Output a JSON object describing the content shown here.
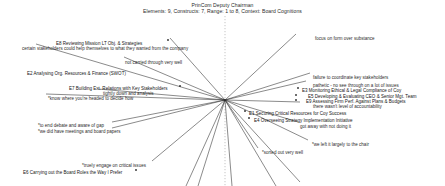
{
  "header": {
    "title": "PrinCom  Deputy Chairman",
    "subtitle": "Elements: 9, Constructs: 7, Range: 1 to 8, Context: Board Cognitions"
  },
  "chart_data": {
    "type": "scatter",
    "title": "PrinCom  Deputy Chairman",
    "subtitle": "Elements: 9, Constructs: 7, Range: 1 to 8, Context: Board Cognitions",
    "xlabel": "",
    "ylabel": "",
    "grid": false,
    "legend": "none",
    "n_elements": 9,
    "n_constructs": 7,
    "rating_range": [
      1,
      8
    ],
    "context": "Board Cognitions",
    "origin": {
      "x": 225,
      "y": 100
    },
    "axis": {
      "type": "dotted-vertical",
      "x": 225,
      "y1": 16,
      "y2": 186
    },
    "elements": [
      {
        "id": "E8",
        "label": "E8 Reviewing Mission LT Obj. & Strategies",
        "x": 56,
        "y": 41,
        "marker_x": 168,
        "marker_y": 40
      },
      {
        "id": "E2",
        "label": "E2 Analysing Org. Resources & Finance  (SWOT)",
        "x": 27,
        "y": 71,
        "marker_x": null,
        "marker_y": null
      },
      {
        "id": "E7",
        "label": "E7 Building Ext. Relations with Key Stakeholders",
        "x": 69,
        "y": 86,
        "marker_x": 180,
        "marker_y": 86
      },
      {
        "id": "E6",
        "label": "E6 Carrying out the Board Roles the Way I Prefer",
        "x": 23,
        "y": 170,
        "marker_x": 136,
        "marker_y": 170
      },
      {
        "id": "E3",
        "label": "E3 Monitoring Ethical & Legal Compliance of Coy",
        "x": 302,
        "y": 88,
        "marker_x": 298,
        "marker_y": 88
      },
      {
        "id": "E5",
        "label": "E5 Developing & Evaluating CEO & Senior Mgt. Team",
        "x": 308,
        "y": 94,
        "marker_x": 296,
        "marker_y": 95
      },
      {
        "id": "E9",
        "label": "E9 Assessing Firm Perf. Against Plans & Budgets",
        "x": 306,
        "y": 99,
        "marker_x": 296,
        "marker_y": 100
      },
      {
        "id": "E1",
        "label": "E1 Securing Critical Resources for Coy Success",
        "x": 249,
        "y": 111,
        "marker_x": 245,
        "marker_y": 111
      },
      {
        "id": "E4",
        "label": "E4 Overseeing Strategy Implementation Initiative",
        "x": 254,
        "y": 118,
        "marker_x": 249,
        "marker_y": 118
      }
    ],
    "construct_poles": [
      {
        "text": "certain stakeholders could help themselves to what they wanted from the company",
        "x": 22,
        "y": 46
      },
      {
        "text": "not carried through very well",
        "x": 125,
        "y": 60
      },
      {
        "text": "tightly down and analysis",
        "x": 103,
        "y": 91
      },
      {
        "text": "*know where you're headed to decide how",
        "x": 48,
        "y": 96
      },
      {
        "text": "*to end debate and aware of gap",
        "x": 38,
        "y": 123
      },
      {
        "text": "*we did have meetings and board papers",
        "x": 38,
        "y": 129
      },
      {
        "text": "*truely engage on critical issues",
        "x": 82,
        "y": 163
      },
      {
        "text": "focus on form over substance",
        "x": 315,
        "y": 36
      },
      {
        "text": "failure to coordinate key stakeholders",
        "x": 313,
        "y": 75
      },
      {
        "text": "pathetic - no see through on a lot of issues",
        "x": 313,
        "y": 83
      },
      {
        "text": "there wasn't level of accountability",
        "x": 313,
        "y": 104
      },
      {
        "text": "got away with not doing it",
        "x": 300,
        "y": 124
      },
      {
        "text": "*we left it largely to the chair",
        "x": 312,
        "y": 142
      },
      {
        "text": "*sorted out very well",
        "x": 262,
        "y": 150
      }
    ],
    "rays": [
      {
        "to_x": 36,
        "to_y": 44
      },
      {
        "to_x": 124,
        "to_y": 57
      },
      {
        "to_x": 98,
        "to_y": 89
      },
      {
        "to_x": 46,
        "to_y": 94
      },
      {
        "to_x": 112,
        "to_y": 122
      },
      {
        "to_x": 112,
        "to_y": 128
      },
      {
        "to_x": 152,
        "to_y": 161
      },
      {
        "to_x": 296,
        "to_y": 34
      },
      {
        "to_x": 310,
        "to_y": 73
      },
      {
        "to_x": 306,
        "to_y": 81
      },
      {
        "to_x": 300,
        "to_y": 102
      },
      {
        "to_x": 298,
        "to_y": 122
      },
      {
        "to_x": 308,
        "to_y": 140
      },
      {
        "to_x": 258,
        "to_y": 148
      },
      {
        "to_x": 170,
        "to_y": 38
      },
      {
        "to_x": 198,
        "to_y": 186
      },
      {
        "to_x": 232,
        "to_y": 186
      },
      {
        "to_x": 276,
        "to_y": 186
      },
      {
        "to_x": 300,
        "to_y": 182
      },
      {
        "to_x": 186,
        "to_y": 186
      }
    ],
    "colors": {
      "line": "#2b2b2b",
      "axis": "#8a8a8a",
      "text": "#1f1f1f",
      "background": "#ffffff"
    }
  }
}
